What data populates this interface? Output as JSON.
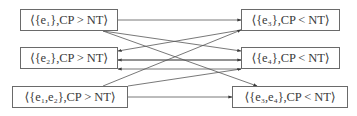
{
  "diagram": {
    "type": "bipartite-state-transition",
    "colors": {
      "line": "#555555",
      "border": "#6a6a6a",
      "text": "#3a3a3a",
      "background": "#ffffff"
    },
    "nodes": [
      {
        "id": "L1",
        "label": "⟨{e₁},CP > NT⟩",
        "events": "e₁",
        "relation": ">",
        "side": "left",
        "x": 20,
        "y": 9,
        "w": 98,
        "h": 22
      },
      {
        "id": "L2",
        "label": "⟨{e₂},CP > NT⟩",
        "events": "e₂",
        "relation": ">",
        "side": "left",
        "x": 20,
        "y": 47,
        "w": 98,
        "h": 22
      },
      {
        "id": "L3",
        "label": "⟨{e₁,e₂},CP > NT⟩",
        "events": "e₁,e₂",
        "relation": ">",
        "side": "left",
        "x": 12,
        "y": 86,
        "w": 116,
        "h": 22
      },
      {
        "id": "R1",
        "label": "⟨{e₃},CP < NT⟩",
        "events": "e₃",
        "relation": "<",
        "side": "right",
        "x": 241,
        "y": 9,
        "w": 99,
        "h": 22
      },
      {
        "id": "R2",
        "label": "⟨{e₄},CP < NT⟩",
        "events": "e₄",
        "relation": "<",
        "side": "right",
        "x": 241,
        "y": 47,
        "w": 99,
        "h": 22
      },
      {
        "id": "R3",
        "label": "⟨{e₃,e₄},CP < NT⟩",
        "events": "e₃,e₄",
        "relation": "<",
        "side": "right",
        "x": 232,
        "y": 86,
        "w": 116,
        "h": 22
      }
    ],
    "edges": [
      {
        "from": "L1",
        "to": "R1",
        "x1": 118,
        "y1": 20,
        "x2": 241,
        "y2": 20
      },
      {
        "from": "L1",
        "to": "R2",
        "x1": 103,
        "y1": 31,
        "x2": 241,
        "y2": 51
      },
      {
        "from": "L1",
        "to": "R3",
        "x1": 103,
        "y1": 31,
        "x2": 257,
        "y2": 86
      },
      {
        "from": "R1",
        "to": "L2",
        "x1": 241,
        "y1": 30,
        "x2": 118,
        "y2": 51
      },
      {
        "from": "R2",
        "to": "L2",
        "x1": 241,
        "y1": 60,
        "x2": 118,
        "y2": 60
      },
      {
        "from": "L2",
        "to": "R2",
        "x1": 118,
        "y1": 60,
        "x2": 241,
        "y2": 60
      },
      {
        "from": "R3",
        "to": "L2",
        "x1": 241,
        "y1": 69,
        "x2": 118,
        "y2": 69
      },
      {
        "from": "L3",
        "to": "R1",
        "x1": 103,
        "y1": 86,
        "x2": 241,
        "y2": 30
      },
      {
        "from": "L3",
        "to": "R2",
        "x1": 128,
        "y1": 86,
        "x2": 241,
        "y2": 69
      },
      {
        "from": "L3",
        "to": "R3",
        "x1": 128,
        "y1": 97,
        "x2": 232,
        "y2": 97
      }
    ]
  }
}
